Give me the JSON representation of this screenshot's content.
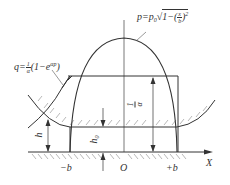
{
  "diagram": {
    "type": "contact-pressure-film-thickness",
    "labels": {
      "p_formula_lhs": "p=p",
      "p_formula_sub": "0",
      "p_formula_body": "1−(",
      "p_formula_frac_num": "x",
      "p_formula_frac_den": "b",
      "p_formula_close": ")",
      "p_formula_exp": "2",
      "q_formula_lhs": "q=",
      "q_formula_frac_num": "1",
      "q_formula_frac_den": "α",
      "q_formula_body": "(1−e",
      "q_formula_exp": "αp",
      "q_formula_close": ")",
      "h": "h",
      "h0": "h",
      "h0_sub": "0",
      "inv_alpha_num": "1",
      "inv_alpha_den": "α",
      "neg_b": "−b",
      "origin": "O",
      "pos_b": "+b",
      "x_axis": "X"
    },
    "colors": {
      "line": "#333333",
      "hatch": "#777777",
      "background": "#ffffff"
    }
  }
}
